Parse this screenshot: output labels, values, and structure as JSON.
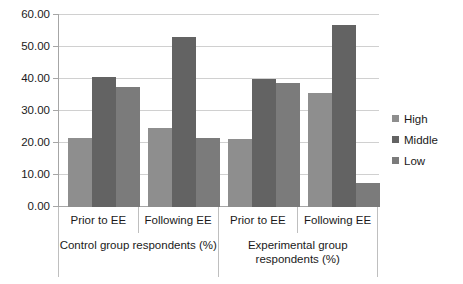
{
  "chart_data": {
    "type": "bar",
    "title": "",
    "xlabel": "",
    "ylabel": "",
    "ylim": [
      0,
      60
    ],
    "ytick_step": 10,
    "grid": true,
    "legend_position": "right",
    "yticks": [
      "0.00",
      "10.00",
      "20.00",
      "30.00",
      "40.00",
      "50.00",
      "60.00"
    ],
    "categories": [
      "Prior to EE",
      "Following EE",
      "Prior to EE",
      "Following EE"
    ],
    "group_labels": [
      {
        "line1": "Control group respondents (%)",
        "line2": ""
      },
      {
        "line1": "Experimental group",
        "line2": "respondents (%)"
      }
    ],
    "series": [
      {
        "name": "High",
        "color": "#8e8e8e",
        "values": [
          21.7,
          24.8,
          21.2,
          35.5
        ]
      },
      {
        "name": "Middle",
        "color": "#636363",
        "values": [
          40.7,
          53.0,
          40.0,
          57.0
        ]
      },
      {
        "name": "Low",
        "color": "#7b7b7b",
        "values": [
          37.5,
          21.6,
          38.7,
          7.5
        ]
      }
    ]
  },
  "legend": {
    "items": [
      {
        "label": "High"
      },
      {
        "label": "Middle"
      },
      {
        "label": "Low"
      }
    ]
  }
}
